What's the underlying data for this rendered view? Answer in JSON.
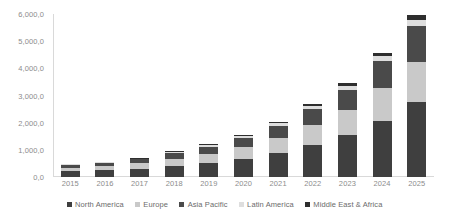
{
  "chart_data": {
    "type": "bar",
    "stacked": true,
    "title": "",
    "subtitle": "",
    "xlabel": "",
    "ylabel": "",
    "grid": false,
    "legend_position": "bottom",
    "categories": [
      "2015",
      "2016",
      "2017",
      "2018",
      "2019",
      "2020",
      "2021",
      "2022",
      "2023",
      "2024",
      "2025"
    ],
    "ylim": [
      0,
      6000
    ],
    "yticks": [
      0,
      1000,
      2000,
      3000,
      4000,
      5000,
      6000
    ],
    "ytick_labels": [
      "0,0",
      "1,000,0",
      "2,000,0",
      "3,000,0",
      "4,000,0",
      "5,000,0",
      "6,000,0"
    ],
    "series": [
      {
        "name": "North America",
        "color": "#3f3f3f",
        "values": [
          210,
          240,
          300,
          410,
          520,
          660,
          880,
          1180,
          1560,
          2080,
          2750
        ]
      },
      {
        "name": "Europe",
        "color": "#c9c9c9",
        "values": [
          140,
          160,
          200,
          270,
          340,
          430,
          560,
          720,
          900,
          1180,
          1500
        ]
      },
      {
        "name": "Asia Pacific",
        "color": "#4a4a4a",
        "values": [
          100,
          120,
          150,
          200,
          260,
          340,
          450,
          600,
          760,
          1000,
          1300
        ]
      },
      {
        "name": "Latin America",
        "color": "#dedede",
        "values": [
          20,
          25,
          30,
          40,
          50,
          65,
          85,
          110,
          140,
          180,
          230
        ]
      },
      {
        "name": "Middle East & Africa",
        "color": "#2e2e2e",
        "values": [
          15,
          18,
          22,
          30,
          40,
          50,
          65,
          85,
          110,
          140,
          180
        ]
      }
    ],
    "totals": [
      485,
      563,
      702,
      950,
      1210,
      1545,
      2040,
      2695,
      3470,
      4580,
      5960
    ]
  },
  "legend": {
    "items": [
      {
        "label": "North America",
        "color": "#3f3f3f"
      },
      {
        "label": "Europe",
        "color": "#c9c9c9"
      },
      {
        "label": "Asia Pacific",
        "color": "#4a4a4a"
      },
      {
        "label": "Latin America",
        "color": "#dedede"
      },
      {
        "label": "Middle East & Africa",
        "color": "#2e2e2e"
      }
    ]
  }
}
